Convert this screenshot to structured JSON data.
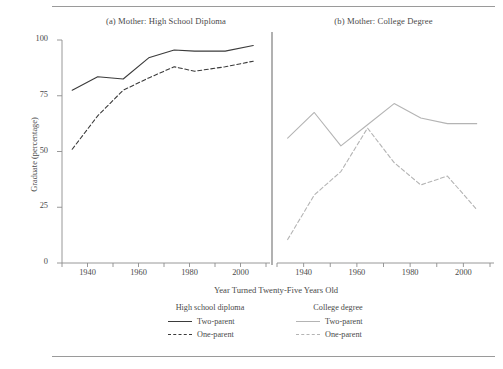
{
  "figure": {
    "ylabel": "Graduate (percentage)",
    "xlabel": "Year Turned Twenty-Five Years Old",
    "panel_a_title": "(a) Mother: High School Diploma",
    "panel_b_title": "(b) Mother: College Degree"
  },
  "legend": {
    "col1_heading": "High school diploma",
    "col1_items": [
      {
        "label": "Two-parent",
        "style": "solid",
        "color": "#3b3b3b"
      },
      {
        "label": "One-parent",
        "style": "dashed",
        "color": "#3b3b3b"
      }
    ],
    "col2_heading": "College degree",
    "col2_items": [
      {
        "label": "Two-parent",
        "style": "solid",
        "color": "#b4b4b4"
      },
      {
        "label": "One-parent",
        "style": "dashed",
        "color": "#b4b4b4"
      }
    ]
  },
  "chart_data": {
    "type": "line",
    "xlabel": "Year Turned Twenty-Five Years Old",
    "ylabel": "Graduate (percentage)",
    "ylim": [
      0,
      100
    ],
    "yticks": [
      0,
      25,
      50,
      75,
      100
    ],
    "ytick_labels": [
      "0",
      "25",
      "50",
      "75",
      "100"
    ],
    "xlim": [
      1930,
      2010
    ],
    "xticks": [
      1930,
      1940,
      1950,
      1960,
      1970,
      1980,
      1990,
      2000,
      2010
    ],
    "xtick_labels": [
      "",
      "1940",
      "",
      "1960",
      "",
      "1980",
      "",
      "2000",
      ""
    ],
    "grid": false,
    "legend_position": "bottom",
    "panels": [
      {
        "id": "a",
        "title": "(a) Mother: High School Diploma",
        "series": [
          {
            "name": "Two-parent",
            "style": "solid",
            "color": "#3b3b3b",
            "x": [
              1934,
              1944,
              1954,
              1964,
              1974,
              1982,
              1994,
              2005
            ],
            "values": [
              77.5,
              83.5,
              82.5,
              92.0,
              95.5,
              95.0,
              95.0,
              97.5
            ]
          },
          {
            "name": "One-parent",
            "style": "dashed",
            "color": "#3b3b3b",
            "x": [
              1934,
              1944,
              1954,
              1964,
              1974,
              1982,
              1994,
              2005
            ],
            "values": [
              51.0,
              66.0,
              77.5,
              83.0,
              88.0,
              86.0,
              88.0,
              90.5
            ]
          }
        ]
      },
      {
        "id": "b",
        "title": "(b) Mother: College Degree",
        "series": [
          {
            "name": "Two-parent",
            "style": "solid",
            "color": "#b4b4b4",
            "x": [
              1934,
              1944,
              1954,
              1964,
              1974,
              1984,
              1994,
              2005
            ],
            "values": [
              56.0,
              67.5,
              52.5,
              62.0,
              71.5,
              65.0,
              62.5,
              62.5
            ]
          },
          {
            "name": "One-parent",
            "style": "dashed",
            "color": "#b4b4b4",
            "x": [
              1934,
              1944,
              1954,
              1964,
              1974,
              1984,
              1994,
              2005
            ],
            "values": [
              10.5,
              30.5,
              41.0,
              60.5,
              45.0,
              35.0,
              39.0,
              24.0
            ]
          }
        ]
      }
    ]
  }
}
